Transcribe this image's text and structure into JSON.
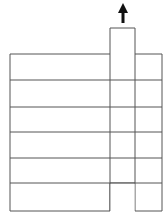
{
  "diagram": {
    "stroke": "#555555",
    "arrow_color": "#111111",
    "rows": 6,
    "row_lines_y": [
      54,
      80,
      107,
      132,
      158,
      183,
      211
    ],
    "col_lines_x": [
      10,
      110,
      135,
      162
    ],
    "tab": {
      "x1": 110,
      "x2": 135,
      "top": 28
    },
    "gap": {
      "x1": 110,
      "x2": 135,
      "row_top": 183
    },
    "arrow": {
      "x": 123,
      "tip_y": 4,
      "base_y": 23,
      "direction": "up"
    }
  }
}
